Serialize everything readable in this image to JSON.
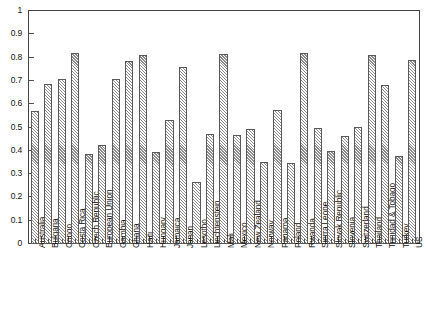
{
  "chart_data": {
    "type": "bar",
    "title": "",
    "subtitle": "",
    "xlabel": "",
    "ylabel": "",
    "ylim": [
      0,
      1
    ],
    "xlim_categories": 29,
    "grid": false,
    "legend": null,
    "y_ticks": [
      "0",
      "0.1",
      "0.2",
      "0.3",
      "0.4",
      "0.5",
      "0.6",
      "0.7",
      "0.8",
      "0.9",
      "1"
    ],
    "y_tick_values": [
      0,
      0.1,
      0.2,
      0.3,
      0.4,
      0.5,
      0.6,
      0.7,
      0.8,
      0.9,
      1
    ],
    "categories": [
      "Australia",
      "Bulgaria",
      "Congo",
      "Costa Rica",
      "Czech Republic",
      "European Union",
      "Gambia",
      "Ghana",
      "Haiti",
      "Hungary",
      "Jamaica",
      "Japan",
      "Lesotho",
      "Liechtenstein",
      "Mali",
      "Mexico",
      "New Zealand",
      "Norway",
      "Panama",
      "Poland",
      "Rwanda",
      "Sierra Leone",
      "Slovak Republic",
      "Slovenia",
      "Switzerland",
      "Thailand",
      "Trinidad & Tobago",
      "Turkey",
      "US"
    ],
    "values": [
      0.565,
      0.683,
      0.702,
      0.816,
      0.383,
      0.42,
      0.706,
      0.782,
      0.807,
      0.392,
      0.53,
      0.754,
      0.261,
      0.469,
      0.811,
      0.464,
      0.491,
      0.348,
      0.572,
      0.343,
      0.816,
      0.492,
      0.396,
      0.458,
      0.496,
      0.807,
      0.677,
      0.374,
      0.784
    ],
    "bar_style": {
      "fill": "#ffffff",
      "hatch": "/",
      "hatch_color": "#8e8e8e",
      "edge_color": "#5a5a5a"
    },
    "axis_color": "#444444",
    "background_color": "#ffffff"
  }
}
